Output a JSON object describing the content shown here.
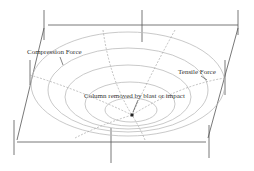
{
  "diagram": {
    "labels": {
      "compression": "Compression Force",
      "tensile": "Tensile Force",
      "column": "Column removed by blast or impact"
    },
    "colors": {
      "frame": "#555555",
      "rings": "#bbbbbb",
      "dashed": "#999999",
      "text": "#333333"
    },
    "ring_count": 5
  }
}
